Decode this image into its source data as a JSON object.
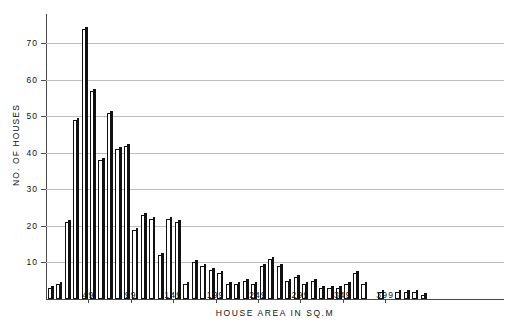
{
  "chart_data": {
    "type": "bar",
    "title": "",
    "xlabel": "HOUSE AREA IN SQ.M",
    "ylabel": "NO. OF HOUSES",
    "ylim": [
      0,
      78
    ],
    "yticks": [
      10,
      20,
      30,
      40,
      50,
      60,
      70
    ],
    "xtick_labels": [
      "49",
      "99",
      "149",
      "199",
      "249",
      "299",
      "349",
      "399"
    ],
    "xtick_values": [
      49,
      99,
      149,
      199,
      249,
      299,
      349,
      399
    ],
    "grid": true,
    "legend": "none",
    "bin_width": 10,
    "x": [
      4,
      14,
      24,
      34,
      44,
      54,
      64,
      74,
      84,
      94,
      104,
      114,
      124,
      134,
      144,
      154,
      164,
      174,
      184,
      194,
      204,
      214,
      224,
      234,
      244,
      254,
      264,
      274,
      284,
      294,
      304,
      314,
      324,
      334,
      344,
      354,
      364,
      374,
      384,
      394,
      404,
      414,
      424,
      434,
      444,
      454,
      464,
      474,
      484,
      494,
      504,
      514,
      524,
      534
    ],
    "values": [
      3,
      4,
      21,
      49,
      74,
      57,
      38,
      51,
      41,
      42,
      19,
      23,
      22,
      12,
      22,
      21,
      4,
      10,
      9,
      8,
      7,
      4,
      4,
      5,
      4,
      9,
      11,
      9,
      5,
      6,
      4,
      5,
      3,
      3,
      3,
      4,
      7,
      4,
      0,
      2,
      0,
      2,
      2,
      2,
      1,
      0,
      0,
      0,
      0,
      0,
      0,
      0,
      0,
      0
    ],
    "n_bars": 54,
    "max_value": 74,
    "bar_style": "white-fill-black-outline-with-drop-shadow"
  },
  "axis": {
    "y_title": "NO. OF HOUSES",
    "x_title": "HOUSE AREA IN SQ.M"
  }
}
